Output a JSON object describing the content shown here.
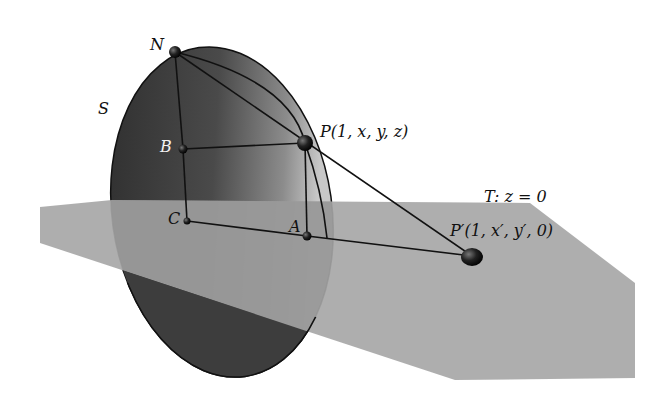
{
  "figure": {
    "sphere": {
      "label": "S",
      "color_dark": "#3a3a3a",
      "color_light": "#9a9a9a"
    },
    "plane": {
      "label": "T: z = 0",
      "color": "#a6a6a6"
    },
    "points": [
      {
        "id": "N",
        "label": "N",
        "x": 175,
        "y": 52
      },
      {
        "id": "P",
        "label": "P(1, x, y, z)",
        "x": 305,
        "y": 143
      },
      {
        "id": "B",
        "label": "B",
        "x": 183,
        "y": 149
      },
      {
        "id": "C",
        "label": "C",
        "x": 187,
        "y": 221
      },
      {
        "id": "A",
        "label": "A",
        "x": 307,
        "y": 236
      },
      {
        "id": "Pprime",
        "label": "P′(1, x′, y′, 0)",
        "x": 472,
        "y": 256
      }
    ],
    "segments": [
      "N-P",
      "P-Pprime",
      "N-B",
      "B-C",
      "B-P",
      "C-A",
      "A-Pprime",
      "P-A"
    ]
  }
}
